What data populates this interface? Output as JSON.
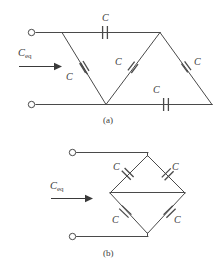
{
  "figure": {
    "background_color": "#ffffff",
    "line_color": "#4a4a4a",
    "text_color": "#3a3a3a"
  },
  "circuits": [
    {
      "id": "a",
      "part_label": "(a)",
      "source_label": "C",
      "source_label_sub": "eq",
      "capacitor_labels": [
        "C",
        "C",
        "C",
        "C",
        "C"
      ],
      "capacitor_count": 5
    },
    {
      "id": "b",
      "part_label": "(b)",
      "source_label": "C",
      "source_label_sub": "eq",
      "capacitor_labels": [
        "C",
        "C",
        "C",
        "C"
      ],
      "capacitor_count": 4
    }
  ],
  "labels": {
    "a_cap_top": "C",
    "a_cap_left": "C",
    "a_cap_mid": "C",
    "a_cap_right": "C",
    "a_cap_bottom": "C",
    "a_ceq_main": "C",
    "a_ceq_sub": "eq",
    "a_part": "(a)",
    "b_cap_topleft": "C",
    "b_cap_topright": "C",
    "b_cap_bottomleft": "C",
    "b_cap_bottomright": "C",
    "b_ceq_main": "C",
    "b_ceq_sub": "eq",
    "b_part": "(b)"
  }
}
